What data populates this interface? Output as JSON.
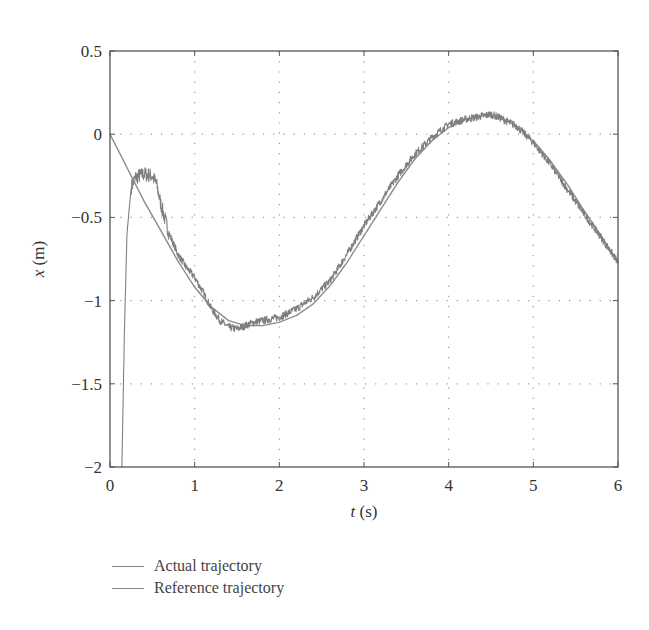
{
  "chart_data": {
    "type": "line",
    "title": "",
    "xlabel": "t (s)",
    "ylabel": "x (m)",
    "xlim": [
      0,
      6
    ],
    "ylim": [
      -2,
      0.5
    ],
    "xticks": [
      0,
      1,
      2,
      3,
      4,
      5,
      6
    ],
    "xtick_labels": [
      "0",
      "1",
      "2",
      "3",
      "4",
      "5",
      "6"
    ],
    "yticks": [
      0.5,
      0,
      -0.5,
      -1,
      -1.5,
      -2
    ],
    "ytick_labels": [
      "0.5",
      "0",
      "−0.5",
      "−1",
      "−1.5",
      "−2"
    ],
    "grid": true,
    "grid_style": "dotted",
    "legend_position": "below",
    "series": [
      {
        "name": "Actual trajectory",
        "color": "#7f7f7f",
        "noisy": true,
        "x": [
          0.14,
          0.17,
          0.2,
          0.25,
          0.3,
          0.4,
          0.5,
          0.55,
          0.6,
          0.7,
          0.8,
          0.9,
          1.0,
          1.1,
          1.2,
          1.3,
          1.4,
          1.5,
          1.6,
          1.7,
          1.8,
          2.0,
          2.2,
          2.4,
          2.6,
          2.8,
          3.0,
          3.2,
          3.4,
          3.6,
          3.8,
          4.0,
          4.2,
          4.4,
          4.5,
          4.6,
          4.8,
          5.0,
          5.2,
          5.4,
          5.6,
          5.8,
          6.0
        ],
        "y": [
          -2.0,
          -1.2,
          -0.6,
          -0.32,
          -0.26,
          -0.24,
          -0.25,
          -0.3,
          -0.42,
          -0.6,
          -0.72,
          -0.8,
          -0.86,
          -0.95,
          -1.05,
          -1.12,
          -1.16,
          -1.17,
          -1.15,
          -1.13,
          -1.12,
          -1.1,
          -1.05,
          -0.98,
          -0.88,
          -0.72,
          -0.55,
          -0.4,
          -0.25,
          -0.12,
          -0.02,
          0.06,
          0.09,
          0.11,
          0.12,
          0.1,
          0.05,
          -0.05,
          -0.18,
          -0.33,
          -0.48,
          -0.62,
          -0.77
        ]
      },
      {
        "name": "Reference trajectory",
        "color": "#8a8a8a",
        "noisy": false,
        "x": [
          0.0,
          0.2,
          0.4,
          0.6,
          0.8,
          1.0,
          1.2,
          1.4,
          1.6,
          1.8,
          2.0,
          2.2,
          2.4,
          2.6,
          2.8,
          3.0,
          3.2,
          3.4,
          3.6,
          3.8,
          4.0,
          4.2,
          4.4,
          4.5,
          4.6,
          4.8,
          5.0,
          5.2,
          5.4,
          5.6,
          5.8,
          6.0
        ],
        "y": [
          0.0,
          -0.2,
          -0.4,
          -0.58,
          -0.76,
          -0.92,
          -1.04,
          -1.12,
          -1.15,
          -1.15,
          -1.13,
          -1.09,
          -1.02,
          -0.91,
          -0.77,
          -0.61,
          -0.45,
          -0.29,
          -0.15,
          -0.04,
          0.04,
          0.09,
          0.11,
          0.11,
          0.1,
          0.05,
          -0.04,
          -0.16,
          -0.3,
          -0.46,
          -0.61,
          -0.77
        ]
      }
    ]
  },
  "legend": {
    "items": [
      {
        "label": "Actual trajectory"
      },
      {
        "label": "Reference trajectory"
      }
    ]
  }
}
